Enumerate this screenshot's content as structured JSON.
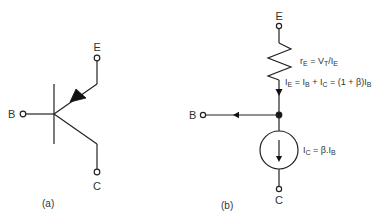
{
  "colors": {
    "line": "#222222",
    "text": "#333333",
    "background": "#ffffff"
  },
  "panel_a": {
    "caption": "(a)",
    "terminals": {
      "base": "B",
      "emitter": "E",
      "collector": "C"
    },
    "symbol": "pnp-transistor"
  },
  "panel_b": {
    "caption": "(b)",
    "terminals": {
      "base": "B",
      "emitter": "E",
      "collector": "C"
    },
    "resistor_label": {
      "main": "r",
      "main_sub": "E",
      "rhs1": " = V",
      "rhs1_sub": "T",
      "rhs2": "/I",
      "rhs2_sub": "E"
    },
    "emitter_current_label": {
      "p1": "I",
      "p1_sub": "E",
      "p2": " = I",
      "p2_sub": "B",
      "p3": " + I",
      "p3_sub": "C",
      "p4": " = (1 + β)I",
      "p4_sub": "B"
    },
    "source_label": {
      "p1": "I",
      "p1_sub": "C",
      "p2": " = β.I",
      "p2_sub": "B"
    }
  }
}
